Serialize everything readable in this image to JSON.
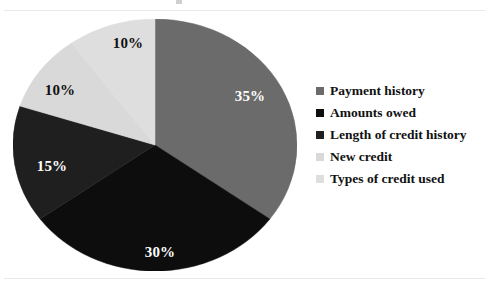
{
  "chart_data": {
    "type": "pie",
    "title": "",
    "categories": [
      "Payment history",
      "Amounts owed",
      "Length of credit history",
      "New credit",
      "Types of credit used"
    ],
    "values": [
      35,
      30,
      15,
      10,
      10
    ],
    "value_labels": [
      "35%",
      "30%",
      "15%",
      "10%",
      "10%"
    ],
    "colors": [
      "#6b6b6b",
      "#0d0d0d",
      "#1f1f1f",
      "#d9d9d9",
      "#dedede"
    ],
    "label_text_colors": [
      "#ffffff",
      "#ffffff",
      "#ffffff",
      "#111111",
      "#111111"
    ],
    "start_angle_deg": 0,
    "direction": "clockwise",
    "legend_position": "right",
    "grid": false,
    "units": "percent",
    "total": 100
  },
  "legend": {
    "items": [
      {
        "label": "Payment history",
        "color": "#6b6b6b"
      },
      {
        "label": "Amounts owed",
        "color": "#0d0d0d"
      },
      {
        "label": "Length of credit history",
        "color": "#1f1f1f"
      },
      {
        "label": "New credit",
        "color": "#d9d9d9"
      },
      {
        "label": "Types of credit used",
        "color": "#dedede"
      }
    ]
  },
  "slice_labels": [
    {
      "text": "35%",
      "x": 250,
      "y": 96,
      "tone": "on-dark"
    },
    {
      "text": "30%",
      "x": 160,
      "y": 252,
      "tone": "on-dark"
    },
    {
      "text": "15%",
      "x": 52,
      "y": 166,
      "tone": "on-dark"
    },
    {
      "text": "10%",
      "x": 60,
      "y": 90,
      "tone": "on-light"
    },
    {
      "text": "10%",
      "x": 128,
      "y": 43,
      "tone": "on-light"
    }
  ]
}
